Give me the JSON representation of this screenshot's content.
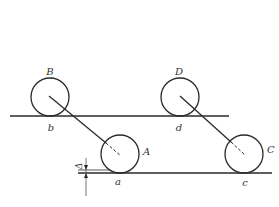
{
  "diagram": {
    "labels": {
      "B": "B",
      "b": "b",
      "A": "A",
      "a": "a",
      "D": "D",
      "d": "d",
      "C": "C",
      "c": "c",
      "delta": "Δ"
    },
    "colors": {
      "stroke": "#2a2a2a",
      "background": "#ffffff"
    },
    "elements": {
      "upper_line": "upper horizontal line through b and d",
      "lower_line": "lower horizontal line through a and c",
      "circles": [
        "B",
        "A",
        "D",
        "C"
      ],
      "connectors": [
        "B-A",
        "D-C"
      ],
      "offset_marker": "Δ"
    }
  }
}
